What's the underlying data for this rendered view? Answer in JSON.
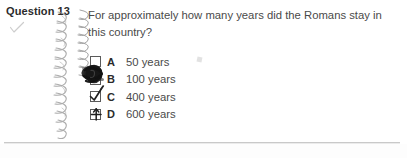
{
  "question": {
    "label": "Question 13",
    "marked_icon": "checkmark-icon",
    "text": "For approximately how many years did the Romans stay in this country?"
  },
  "options": [
    {
      "letter": "A",
      "text": "50 years",
      "mark": "empty",
      "mark_icon": "empty-checkbox-icon"
    },
    {
      "letter": "B",
      "text": "100 years",
      "mark": "scribble",
      "mark_icon": "scribble-blob-icon"
    },
    {
      "letter": "C",
      "text": "400 years",
      "mark": "tick",
      "mark_icon": "checkmark-icon"
    },
    {
      "letter": "D",
      "text": "600 years",
      "mark": "cross",
      "mark_icon": "cross-mark-icon"
    }
  ],
  "artifacts": {
    "spiral_binding": "spiral-binding-icon",
    "smudge": "ink-smudge-icon",
    "divider": "horizontal-rule"
  },
  "colors": {
    "page_background": "#ffffff",
    "body_text": "#4a4a4a",
    "heading_text": "#2b2b2b",
    "checkbox_border": "#5a5a5a",
    "divider": "#c9c9c9",
    "ink_mark": "#1c1c1c",
    "faint_mark": "#bdbdbd"
  }
}
